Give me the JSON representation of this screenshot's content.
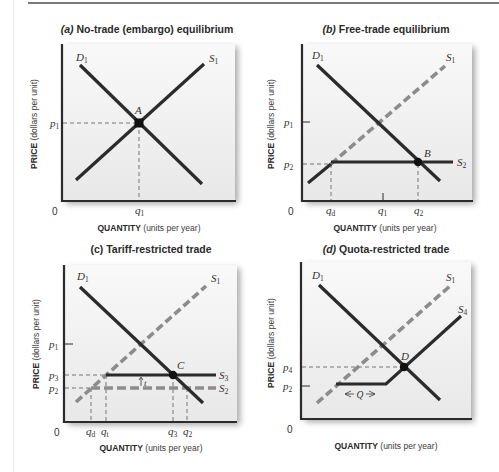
{
  "figure": {
    "colors": {
      "solid_line": "#2b2b2b",
      "dashed_supply": "#8c8c8c",
      "plot_bg_top": "#f8f8f8",
      "plot_bg_bottom": "#e9e9e9",
      "axis": "#2b2b2b",
      "guide_dash": "#555555"
    },
    "panels": [
      {
        "id": "a",
        "title_letter": "(a)",
        "title_text": " No-trade (embargo) equilibrium",
        "ylabel_bold": "PRICE",
        "ylabel_rest": " (dollars per unit)",
        "xlabel_bold": "QUANTITY",
        "xlabel_rest": " (units per year)",
        "origin": "0",
        "curves": {
          "demand": "D",
          "demand_sub": "1",
          "supply": "S",
          "supply_sub": "1"
        },
        "point": "A",
        "y_ticks": [
          {
            "sym": "p",
            "sub": "1"
          }
        ],
        "x_ticks": [
          {
            "sym": "q",
            "sub": "1"
          }
        ]
      },
      {
        "id": "b",
        "title_letter": "(b)",
        "title_text": " Free-trade equilibrium",
        "ylabel_bold": "PRICE",
        "ylabel_rest": " (dollars per unit)",
        "xlabel_bold": "QUANTITY",
        "xlabel_rest": " (units per year)",
        "origin": "0",
        "curves": {
          "demand": "D",
          "demand_sub": "1",
          "supply": "S",
          "supply_sub": "1",
          "world_supply": "S",
          "world_supply_sub": "2"
        },
        "point": "B",
        "y_ticks": [
          {
            "sym": "p",
            "sub": "1"
          },
          {
            "sym": "p",
            "sub": "2"
          }
        ],
        "x_ticks": [
          {
            "sym": "q",
            "sub": "d"
          },
          {
            "sym": "q",
            "sub": "1"
          },
          {
            "sym": "q",
            "sub": "2"
          }
        ]
      },
      {
        "id": "c",
        "title_letter": "(c)",
        "title_text": " Tariff-restricted trade",
        "ylabel_bold": "PRICE",
        "ylabel_rest": " (dollars per unit)",
        "xlabel_bold": "QUANTITY",
        "xlabel_rest": " (units per year)",
        "origin": "0",
        "curves": {
          "demand": "D",
          "demand_sub": "1",
          "supply": "S",
          "supply_sub": "1",
          "tariff_supply": "S",
          "tariff_supply_sub": "3",
          "world_supply": "S",
          "world_supply_sub": "2"
        },
        "point": "C",
        "tariff_label": "t",
        "y_ticks": [
          {
            "sym": "p",
            "sub": "1"
          },
          {
            "sym": "p",
            "sub": "3"
          },
          {
            "sym": "p",
            "sub": "2"
          }
        ],
        "x_ticks": [
          {
            "sym": "q",
            "sub": "d"
          },
          {
            "sym": "q",
            "sub": "t"
          },
          {
            "sym": "q",
            "sub": "3"
          },
          {
            "sym": "q",
            "sub": "2"
          }
        ]
      },
      {
        "id": "d",
        "title_letter": "(d)",
        "title_text": " Quota-restricted trade",
        "ylabel_bold": "PRICE",
        "ylabel_rest": " (dollars per unit)",
        "xlabel_bold": "QUANTITY",
        "xlabel_rest": " (units per year)",
        "origin": "0",
        "curves": {
          "demand": "D",
          "demand_sub": "1",
          "supply": "S",
          "supply_sub": "1",
          "quota_supply": "S",
          "quota_supply_sub": "4"
        },
        "point": "D",
        "quota_label": "Q",
        "y_ticks": [
          {
            "sym": "p",
            "sub": "4"
          },
          {
            "sym": "p",
            "sub": "2"
          }
        ],
        "x_ticks": []
      }
    ]
  }
}
